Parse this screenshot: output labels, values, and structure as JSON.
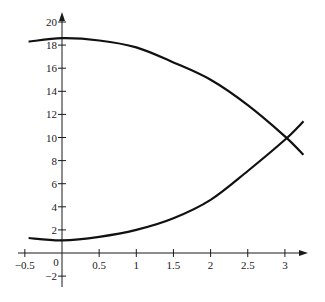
{
  "chart_data": {
    "type": "line",
    "title": "",
    "xlabel": "",
    "ylabel": "",
    "xlim": [
      -0.5,
      3.3
    ],
    "ylim": [
      -2.5,
      21
    ],
    "grid": false,
    "legend": null,
    "x_ticks": [
      -0.5,
      0,
      0.5,
      1,
      1.5,
      2,
      2.5,
      3
    ],
    "x_tick_labels": [
      "-0.5",
      "0",
      "0.5",
      "1",
      "1.5",
      "2",
      "2.5",
      "3"
    ],
    "y_ticks": [
      -2,
      2,
      4,
      6,
      8,
      10,
      12,
      14,
      16,
      18,
      20
    ],
    "y_tick_labels": [
      "-2",
      "2",
      "4",
      "6",
      "8",
      "10",
      "12",
      "14",
      "16",
      "18",
      "20"
    ],
    "x": [
      -0.45,
      0,
      0.5,
      1,
      1.5,
      2,
      2.5,
      3,
      3.25
    ],
    "series": [
      {
        "name": "upper curve",
        "values": [
          18.3,
          18.6,
          18.4,
          17.8,
          16.5,
          15.0,
          12.8,
          10.1,
          8.5
        ]
      },
      {
        "name": "lower curve",
        "values": [
          1.3,
          1.1,
          1.4,
          2.0,
          3.0,
          4.6,
          7.1,
          9.8,
          11.4
        ]
      }
    ],
    "annotations": [
      {
        "type": "intersection",
        "x": 3.0,
        "y": 10.0
      }
    ]
  },
  "axes": {
    "x_labels": [
      "-0.5",
      "0",
      "0.5",
      "1",
      "1.5",
      "2",
      "2.5",
      "3"
    ],
    "y_labels": [
      "20",
      "18",
      "16",
      "14",
      "12",
      "10",
      "8",
      "6",
      "4",
      "2",
      "-2"
    ]
  }
}
